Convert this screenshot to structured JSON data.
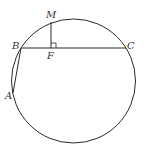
{
  "figure": {
    "type": "geometry",
    "colors": {
      "stroke": "#2a2a2a",
      "label": "#333333",
      "background": "#ffffff"
    },
    "circle": {
      "cx": 73.5,
      "cy": 81,
      "r": 62
    },
    "points": {
      "M": {
        "label": "M",
        "x": 51,
        "y": 22
      },
      "B": {
        "label": "B",
        "x": 21,
        "y": 48
      },
      "C": {
        "label": "C",
        "x": 126,
        "y": 48
      },
      "F": {
        "label": "F",
        "x": 51,
        "y": 48
      },
      "A": {
        "label": "A",
        "x": 13,
        "y": 93
      }
    },
    "segments": [
      "BC",
      "MF",
      "BA"
    ],
    "right_angle_at": "F"
  }
}
